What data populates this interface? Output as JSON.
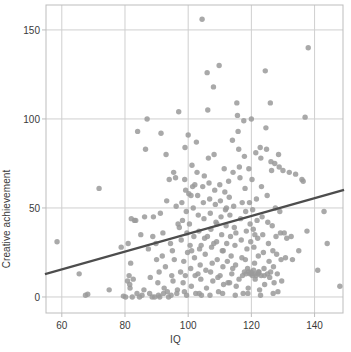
{
  "chart_data": {
    "type": "scatter",
    "title": "",
    "xlabel": "IQ",
    "ylabel": "Creative achievement",
    "xlim": [
      55,
      149
    ],
    "ylim": [
      -9,
      164
    ],
    "xticks": [
      60,
      80,
      100,
      120,
      140
    ],
    "yticks": [
      0,
      50,
      100,
      150
    ],
    "grid": true,
    "legend": null,
    "point_color": "#9a9a9a",
    "point_radius": 2.7,
    "point_opacity": 0.85,
    "grid_color": "#cfcfcf",
    "frame_color": "#bdbdbd",
    "axis_text_color": "#3a3a3a",
    "trendline": {
      "name": "linear fit",
      "color": "#4d4d4d",
      "width": 2.2,
      "x": [
        55,
        149
      ],
      "y": [
        13,
        60
      ],
      "slope": 0.5,
      "intercept": -14.5
    },
    "n_points": 302,
    "points": [
      [
        58.5,
        31
      ],
      [
        65.5,
        13
      ],
      [
        67.5,
        1
      ],
      [
        68.2,
        1.5
      ],
      [
        71.8,
        61
      ],
      [
        75.0,
        4
      ],
      [
        78.8,
        28
      ],
      [
        79.5,
        0.5
      ],
      [
        80.2,
        0
      ],
      [
        80.8,
        9
      ],
      [
        81.0,
        30
      ],
      [
        81.3,
        12
      ],
      [
        81.5,
        7
      ],
      [
        81.8,
        19
      ],
      [
        82.0,
        44
      ],
      [
        82.3,
        0
      ],
      [
        82.6,
        10
      ],
      [
        83.0,
        43
      ],
      [
        83.4,
        43
      ],
      [
        84.0,
        93
      ],
      [
        84.6,
        0
      ],
      [
        85.0,
        35
      ],
      [
        86.0,
        4
      ],
      [
        86.5,
        83
      ],
      [
        87.0,
        100
      ],
      [
        87.4,
        27
      ],
      [
        88.0,
        11
      ],
      [
        88.6,
        0
      ],
      [
        89.0,
        45
      ],
      [
        89.4,
        0
      ],
      [
        89.8,
        30
      ],
      [
        90.0,
        21
      ],
      [
        90.4,
        8
      ],
      [
        90.8,
        14
      ],
      [
        91.0,
        0
      ],
      [
        91.4,
        92
      ],
      [
        91.8,
        23
      ],
      [
        92.0,
        36
      ],
      [
        92.4,
        5
      ],
      [
        92.8,
        17
      ],
      [
        93.0,
        80
      ],
      [
        93.4,
        3
      ],
      [
        93.8,
        0
      ],
      [
        94.0,
        66
      ],
      [
        94.4,
        30
      ],
      [
        94.8,
        12
      ],
      [
        95.0,
        26
      ],
      [
        95.2,
        9
      ],
      [
        95.6,
        21
      ],
      [
        96.0,
        67
      ],
      [
        96.2,
        51
      ],
      [
        96.6,
        4
      ],
      [
        97.0,
        104
      ],
      [
        97.2,
        39
      ],
      [
        97.6,
        14
      ],
      [
        97.8,
        32
      ],
      [
        98.0,
        53
      ],
      [
        98.2,
        43
      ],
      [
        98.4,
        8
      ],
      [
        98.6,
        20
      ],
      [
        98.8,
        3
      ],
      [
        99.0,
        84
      ],
      [
        99.2,
        60
      ],
      [
        99.4,
        48
      ],
      [
        99.6,
        36
      ],
      [
        99.8,
        25
      ],
      [
        100.0,
        91
      ],
      [
        100.2,
        58
      ],
      [
        100.4,
        41
      ],
      [
        100.6,
        29
      ],
      [
        100.8,
        16
      ],
      [
        101.0,
        6
      ],
      [
        101.2,
        74
      ],
      [
        101.4,
        62
      ],
      [
        101.6,
        50
      ],
      [
        101.8,
        34
      ],
      [
        102.0,
        22
      ],
      [
        102.2,
        12
      ],
      [
        102.4,
        2
      ],
      [
        102.6,
        87
      ],
      [
        102.8,
        70
      ],
      [
        103.0,
        57
      ],
      [
        103.2,
        46
      ],
      [
        103.4,
        37
      ],
      [
        103.6,
        27
      ],
      [
        103.8,
        18
      ],
      [
        104.0,
        10
      ],
      [
        104.2,
        1
      ],
      [
        104.4,
        156
      ],
      [
        104.6,
        62
      ],
      [
        104.8,
        53
      ],
      [
        105.0,
        44
      ],
      [
        105.2,
        33
      ],
      [
        105.4,
        24
      ],
      [
        105.6,
        15
      ],
      [
        105.8,
        5
      ],
      [
        106.0,
        126
      ],
      [
        106.2,
        105
      ],
      [
        106.4,
        78
      ],
      [
        106.6,
        64
      ],
      [
        106.8,
        55
      ],
      [
        107.0,
        47
      ],
      [
        107.2,
        38
      ],
      [
        107.4,
        28
      ],
      [
        107.6,
        19
      ],
      [
        107.8,
        9
      ],
      [
        108.0,
        118
      ],
      [
        108.2,
        80
      ],
      [
        108.4,
        60
      ],
      [
        108.6,
        52
      ],
      [
        108.8,
        42
      ],
      [
        109.0,
        31
      ],
      [
        109.2,
        21
      ],
      [
        109.4,
        11
      ],
      [
        109.6,
        3
      ],
      [
        109.8,
        130
      ],
      [
        110.0,
        63
      ],
      [
        110.2,
        54
      ],
      [
        110.4,
        45
      ],
      [
        110.6,
        35
      ],
      [
        110.8,
        26
      ],
      [
        111.0,
        17
      ],
      [
        111.2,
        7
      ],
      [
        111.4,
        72
      ],
      [
        111.6,
        59
      ],
      [
        111.8,
        49
      ],
      [
        112.0,
        40
      ],
      [
        112.2,
        30
      ],
      [
        112.4,
        20
      ],
      [
        112.6,
        8
      ],
      [
        112.8,
        65
      ],
      [
        113.0,
        56
      ],
      [
        113.2,
        46
      ],
      [
        113.4,
        34
      ],
      [
        113.6,
        23
      ],
      [
        113.8,
        13
      ],
      [
        114.0,
        88
      ],
      [
        114.2,
        70
      ],
      [
        114.4,
        51
      ],
      [
        114.6,
        39
      ],
      [
        114.8,
        29
      ],
      [
        115.0,
        18
      ],
      [
        115.2,
        6
      ],
      [
        115.4,
        109
      ],
      [
        115.6,
        102
      ],
      [
        115.8,
        93
      ],
      [
        116.0,
        83
      ],
      [
        116.2,
        73
      ],
      [
        116.4,
        67
      ],
      [
        116.6,
        44
      ],
      [
        116.8,
        32
      ],
      [
        117.0,
        22
      ],
      [
        117.2,
        12
      ],
      [
        117.4,
        2
      ],
      [
        117.6,
        99
      ],
      [
        117.8,
        79
      ],
      [
        118.0,
        61
      ],
      [
        118.2,
        48
      ],
      [
        118.4,
        37
      ],
      [
        118.6,
        27
      ],
      [
        118.8,
        16
      ],
      [
        119.0,
        5
      ],
      [
        119.2,
        72
      ],
      [
        119.4,
        53
      ],
      [
        119.6,
        41
      ],
      [
        119.8,
        31
      ],
      [
        120.0,
        100
      ],
      [
        120.2,
        66
      ],
      [
        120.4,
        49
      ],
      [
        120.6,
        38
      ],
      [
        120.8,
        28
      ],
      [
        121.0,
        19
      ],
      [
        121.2,
        10
      ],
      [
        121.4,
        81
      ],
      [
        121.6,
        55
      ],
      [
        121.8,
        43
      ],
      [
        122.0,
        33
      ],
      [
        122.2,
        23
      ],
      [
        122.4,
        14
      ],
      [
        122.6,
        4
      ],
      [
        122.8,
        84
      ],
      [
        123.0,
        78
      ],
      [
        123.2,
        62
      ],
      [
        123.4,
        45
      ],
      [
        123.6,
        35
      ],
      [
        123.8,
        25
      ],
      [
        124.0,
        16
      ],
      [
        124.2,
        7
      ],
      [
        124.4,
        127
      ],
      [
        124.6,
        95
      ],
      [
        124.8,
        83
      ],
      [
        125.0,
        57
      ],
      [
        125.2,
        42
      ],
      [
        125.4,
        30
      ],
      [
        125.6,
        20
      ],
      [
        125.8,
        11
      ],
      [
        126.0,
        109
      ],
      [
        126.2,
        76
      ],
      [
        126.4,
        71
      ],
      [
        126.6,
        40
      ],
      [
        126.8,
        26
      ],
      [
        127.0,
        17
      ],
      [
        127.2,
        8
      ],
      [
        127.4,
        75
      ],
      [
        127.6,
        50
      ],
      [
        127.8,
        34
      ],
      [
        128.0,
        24
      ],
      [
        128.2,
        13
      ],
      [
        128.4,
        3
      ],
      [
        128.6,
        80
      ],
      [
        128.8,
        73
      ],
      [
        129.0,
        48
      ],
      [
        129.2,
        36
      ],
      [
        129.4,
        21
      ],
      [
        129.6,
        9
      ],
      [
        130.0,
        71
      ],
      [
        130.4,
        36
      ],
      [
        130.8,
        22
      ],
      [
        131.2,
        33
      ],
      [
        132.0,
        70
      ],
      [
        132.6,
        34
      ],
      [
        133.0,
        21
      ],
      [
        134.0,
        69
      ],
      [
        135.0,
        26
      ],
      [
        136.0,
        66
      ],
      [
        136.4,
        65
      ],
      [
        137.0,
        101
      ],
      [
        137.6,
        37
      ],
      [
        138.0,
        140
      ],
      [
        141.0,
        15
      ],
      [
        143.0,
        48
      ],
      [
        144.0,
        30
      ],
      [
        148.0,
        6
      ],
      [
        86.2,
        45
      ],
      [
        88.8,
        34
      ],
      [
        91.2,
        47
      ],
      [
        93.2,
        54
      ],
      [
        95.4,
        70
      ],
      [
        96.8,
        41
      ],
      [
        98.9,
        66
      ],
      [
        99.1,
        12
      ],
      [
        100.9,
        57
      ],
      [
        101.1,
        26
      ],
      [
        102.1,
        63
      ],
      [
        103.1,
        13
      ],
      [
        104.1,
        29
      ],
      [
        105.1,
        68
      ],
      [
        106.1,
        34
      ],
      [
        107.1,
        14
      ],
      [
        108.1,
        30
      ],
      [
        109.1,
        41
      ],
      [
        110.1,
        12
      ],
      [
        111.1,
        26
      ],
      [
        112.1,
        50
      ],
      [
        113.1,
        8
      ],
      [
        114.1,
        16
      ],
      [
        115.1,
        36
      ],
      [
        116.1,
        10
      ],
      [
        117.1,
        53
      ],
      [
        118.1,
        21
      ],
      [
        119.1,
        14
      ],
      [
        120.1,
        13
      ],
      [
        121.1,
        35
      ],
      [
        122.1,
        13
      ],
      [
        123.1,
        12
      ],
      [
        124.1,
        12
      ],
      [
        125.1,
        13
      ],
      [
        126.1,
        14
      ],
      [
        81.6,
        5
      ],
      [
        83.8,
        2
      ],
      [
        85.4,
        1
      ],
      [
        87.8,
        2
      ],
      [
        90.6,
        1
      ],
      [
        92.2,
        2
      ],
      [
        94.6,
        1
      ],
      [
        96.4,
        2
      ],
      [
        99.5,
        1
      ],
      [
        103.5,
        2
      ],
      [
        106.9,
        1
      ],
      [
        110.9,
        2
      ],
      [
        114.9,
        1
      ],
      [
        118.9,
        2
      ],
      [
        122.9,
        1
      ],
      [
        126.9,
        2
      ],
      [
        119.5,
        13
      ],
      [
        120.3,
        12
      ],
      [
        121.0,
        13
      ],
      [
        119.9,
        14
      ],
      [
        120.7,
        15
      ],
      [
        118.3,
        13
      ],
      [
        117.8,
        14
      ],
      [
        121.5,
        12
      ],
      [
        122.3,
        14
      ]
    ]
  },
  "layout": {
    "plot_left": 46,
    "plot_right": 343,
    "plot_top": 5,
    "plot_bottom": 313
  }
}
